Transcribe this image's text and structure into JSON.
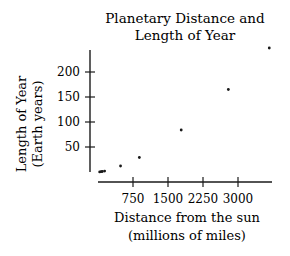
{
  "chart_data": {
    "type": "scatter",
    "title": "Planetary Distance and Length of Year",
    "title_lines": [
      "Planetary Distance and",
      "Length of Year"
    ],
    "xlabel": "Distance from the sun (millions of miles)",
    "xlabel_lines": [
      "Distance from the sun",
      "(millions of miles)"
    ],
    "ylabel": "Length of Year (Earth years)",
    "ylabel_lines": [
      "Length of Year",
      "(Earth years)"
    ],
    "x_ticks": [
      750,
      1500,
      2250,
      3000
    ],
    "y_ticks": [
      50,
      100,
      150,
      200
    ],
    "xlim": [
      0,
      3750
    ],
    "ylim": [
      0,
      250
    ],
    "grid": false,
    "legend": null,
    "points": [
      {
        "x": 36,
        "y": 0.24
      },
      {
        "x": 67,
        "y": 0.62
      },
      {
        "x": 93,
        "y": 1
      },
      {
        "x": 142,
        "y": 1.88
      },
      {
        "x": 483,
        "y": 12
      },
      {
        "x": 886,
        "y": 29
      },
      {
        "x": 1783,
        "y": 84
      },
      {
        "x": 2793,
        "y": 165
      },
      {
        "x": 3670,
        "y": 248
      }
    ]
  },
  "colors": {
    "ink": "#1a1a1a",
    "background": "#ffffff"
  }
}
